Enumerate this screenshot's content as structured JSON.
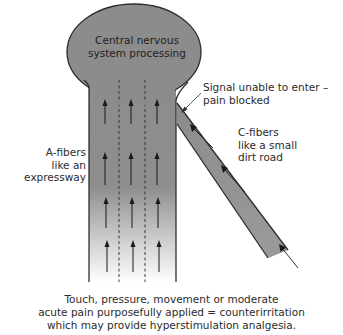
{
  "diagram": {
    "bulb_label": [
      "Central nervous",
      "system processing"
    ],
    "blocked_label": [
      "Signal unable to enter –",
      "pain blocked"
    ],
    "c_fibers_label": [
      "C-fibers",
      "like a small",
      "dirt road"
    ],
    "a_fibers_label": [
      "A-fibers",
      "like an",
      "expressway"
    ],
    "caption": [
      "Touch, pressure, movement or moderate",
      "acute pain purposefully applied = counterirritation",
      "which may provide hyperstimulation analgesia."
    ],
    "colors": {
      "fiber_fill": "#8c8c8c",
      "outline": "#2e2e2e",
      "arrow": "#1a1a1a",
      "text": "#2b2b2b"
    }
  }
}
